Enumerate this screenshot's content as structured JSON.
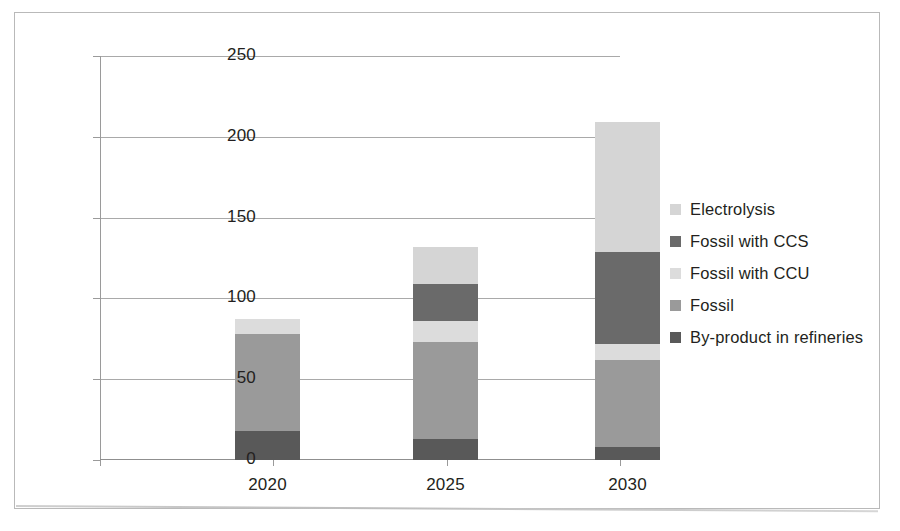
{
  "chart_data": {
    "type": "bar",
    "stacked": true,
    "title": "",
    "subtitle": "",
    "xlabel": "",
    "ylabel": "",
    "categories": [
      "2020",
      "2025",
      "2030"
    ],
    "series": [
      {
        "name": "By-product in refineries",
        "color": "#595959",
        "values": [
          18,
          13,
          8
        ]
      },
      {
        "name": "Fossil",
        "color": "#9a9a9a",
        "values": [
          60,
          60,
          54
        ]
      },
      {
        "name": "Fossil with CCU",
        "color": "#dcdcdc",
        "values": [
          9,
          13,
          10
        ]
      },
      {
        "name": "Fossil with CCS",
        "color": "#6a6a6a",
        "values": [
          0,
          23,
          57
        ]
      },
      {
        "name": "Electrolysis",
        "color": "#d5d5d5",
        "values": [
          0,
          23,
          80
        ]
      }
    ],
    "stack_order_bottom_to_top": [
      "By-product in refineries",
      "Fossil",
      "Fossil with CCU",
      "Fossil with CCS",
      "Electrolysis"
    ],
    "totals": [
      87,
      132,
      209
    ],
    "ylim": [
      0,
      250
    ],
    "ytick_values": [
      0,
      50,
      100,
      150,
      200,
      250
    ],
    "ytick_labels": [
      "0",
      "50",
      "100",
      "150",
      "200",
      "250"
    ],
    "grid": true,
    "grid_axis": "y",
    "legend_position": "right",
    "legend_order_top_to_bottom": [
      "Electrolysis",
      "Fossil with CCS",
      "Fossil with CCU",
      "Fossil",
      "By-product in refineries"
    ]
  },
  "legend": {
    "items": [
      {
        "label": "Electrolysis",
        "color": "#d5d5d5"
      },
      {
        "label": "Fossil with CCS",
        "color": "#6a6a6a"
      },
      {
        "label": "Fossil with CCU",
        "color": "#dcdcdc"
      },
      {
        "label": "Fossil",
        "color": "#9a9a9a"
      },
      {
        "label": "By-product in refineries",
        "color": "#595959"
      }
    ]
  }
}
